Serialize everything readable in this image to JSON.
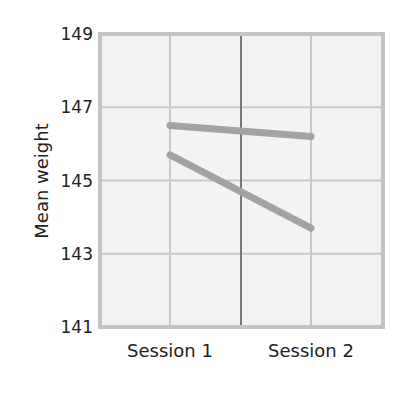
{
  "chart_data": {
    "type": "line",
    "title": "",
    "xlabel": "",
    "ylabel": "Mean weight",
    "categories": [
      "Session 1",
      "Session 2"
    ],
    "yticks": [
      141,
      143,
      145,
      147,
      149
    ],
    "ylim": [
      141,
      149
    ],
    "grid": true,
    "legend": null,
    "series": [
      {
        "name": "Line A",
        "values": [
          146.5,
          146.2
        ]
      },
      {
        "name": "Line B",
        "values": [
          145.7,
          143.7
        ]
      }
    ]
  },
  "colors": {
    "plot_background": "#f3f3f3",
    "frame": "#c4c4c4",
    "grid": "#c8c8c8",
    "center_line": "#777777",
    "series": "#a3a3a3"
  }
}
